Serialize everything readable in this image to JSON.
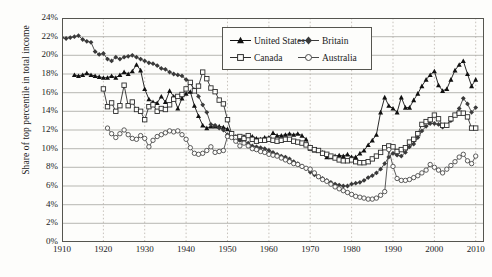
{
  "chart_data": {
    "type": "line",
    "title": "",
    "xlabel": "",
    "ylabel": "Share of top percentile in total income",
    "xlim": [
      1910,
      2012
    ],
    "ylim": [
      0,
      24
    ],
    "grid": true,
    "y_tick_labels": [
      "0%",
      "2%",
      "4%",
      "6%",
      "8%",
      "10%",
      "12%",
      "14%",
      "16%",
      "18%",
      "20%",
      "22%",
      "24%"
    ],
    "y_tick_values": [
      0,
      2,
      4,
      6,
      8,
      10,
      12,
      14,
      16,
      18,
      20,
      22,
      24
    ],
    "x_tick_labels": [
      "1910",
      "1920",
      "1930",
      "1940",
      "1950",
      "1960",
      "1970",
      "1980",
      "1990",
      "2000",
      "2010"
    ],
    "x_tick_values": [
      1910,
      1920,
      1930,
      1940,
      1950,
      1960,
      1970,
      1980,
      1990,
      2000,
      2010
    ],
    "legend_position": "top-center",
    "series": [
      {
        "name": "United States",
        "marker": "filled-triangle",
        "color": "#111111",
        "x": [
          1913,
          1914,
          1915,
          1916,
          1917,
          1918,
          1919,
          1920,
          1921,
          1922,
          1923,
          1924,
          1925,
          1926,
          1927,
          1928,
          1929,
          1930,
          1931,
          1932,
          1933,
          1934,
          1935,
          1936,
          1937,
          1938,
          1939,
          1940,
          1941,
          1942,
          1943,
          1944,
          1945,
          1946,
          1947,
          1948,
          1949,
          1950,
          1951,
          1952,
          1953,
          1954,
          1955,
          1956,
          1957,
          1958,
          1959,
          1960,
          1961,
          1962,
          1963,
          1964,
          1965,
          1966,
          1967,
          1968,
          1969,
          1970,
          1971,
          1972,
          1973,
          1974,
          1975,
          1976,
          1977,
          1978,
          1979,
          1980,
          1981,
          1982,
          1983,
          1984,
          1985,
          1986,
          1987,
          1988,
          1989,
          1990,
          1991,
          1992,
          1993,
          1994,
          1995,
          1996,
          1997,
          1998,
          1999,
          2000,
          2001,
          2002,
          2003,
          2004,
          2005,
          2006,
          2007,
          2008,
          2009,
          2010
        ],
        "values": [
          17.9,
          17.8,
          17.9,
          18.1,
          17.9,
          17.8,
          17.7,
          17.6,
          17.6,
          17.8,
          17.6,
          17.9,
          18.2,
          18.0,
          18.3,
          19.0,
          18.4,
          16.4,
          15.3,
          15.0,
          14.9,
          15.6,
          15.0,
          16.2,
          15.6,
          14.3,
          15.4,
          15.9,
          16.1,
          14.6,
          13.5,
          12.5,
          12.2,
          12.4,
          12.4,
          12.4,
          12.3,
          12.1,
          11.6,
          11.3,
          11.0,
          11.3,
          11.4,
          11.3,
          11.1,
          11.0,
          11.2,
          11.2,
          11.7,
          11.4,
          11.4,
          11.5,
          11.6,
          11.5,
          11.6,
          11.4,
          11.0,
          10.0,
          9.8,
          9.8,
          9.6,
          9.1,
          9.1,
          9.2,
          9.3,
          9.2,
          9.4,
          9.1,
          9.1,
          9.5,
          9.8,
          10.4,
          10.9,
          11.5,
          13.9,
          15.5,
          14.6,
          14.3,
          13.9,
          15.5,
          14.4,
          14.4,
          15.2,
          15.9,
          16.7,
          17.4,
          17.9,
          18.3,
          16.8,
          16.2,
          16.4,
          17.4,
          18.4,
          19.0,
          19.4,
          18.0,
          16.7,
          17.4
        ]
      },
      {
        "name": "Britain",
        "marker": "filled-diamond",
        "color": "#3a3a3a",
        "x": [
          1910,
          1911,
          1912,
          1913,
          1914,
          1915,
          1916,
          1917,
          1918,
          1919,
          1920,
          1921,
          1922,
          1923,
          1924,
          1925,
          1926,
          1927,
          1928,
          1929,
          1930,
          1931,
          1932,
          1933,
          1934,
          1935,
          1936,
          1937,
          1938,
          1939,
          1940,
          1941,
          1942,
          1943,
          1944,
          1945,
          1946,
          1947,
          1948,
          1949,
          1950,
          1951,
          1952,
          1953,
          1954,
          1955,
          1956,
          1957,
          1958,
          1959,
          1960,
          1961,
          1962,
          1963,
          1964,
          1965,
          1966,
          1967,
          1968,
          1969,
          1970,
          1971,
          1972,
          1973,
          1974,
          1975,
          1976,
          1977,
          1978,
          1979,
          1980,
          1981,
          1982,
          1983,
          1984,
          1985,
          1986,
          1987,
          1988,
          1989,
          1990,
          1991,
          1992,
          1993,
          1994,
          1995,
          1996,
          1997,
          1998,
          1999,
          2000,
          2001,
          2002,
          2003,
          2004,
          2005,
          2006,
          2007,
          2008,
          2009,
          2010
        ],
        "values": [
          21.9,
          21.8,
          21.9,
          22.0,
          22.1,
          21.7,
          21.5,
          21.4,
          20.4,
          20.1,
          20.2,
          19.6,
          19.4,
          19.8,
          19.6,
          19.8,
          19.9,
          20.0,
          19.8,
          19.6,
          19.4,
          19.2,
          19.1,
          18.9,
          18.6,
          18.5,
          18.2,
          18.0,
          17.9,
          17.8,
          17.4,
          17.1,
          16.3,
          15.6,
          14.7,
          13.9,
          12.6,
          12.5,
          12.2,
          12.0,
          11.5,
          11.3,
          11.0,
          10.9,
          10.8,
          10.6,
          10.3,
          10.2,
          10.1,
          10.0,
          9.8,
          9.6,
          9.4,
          9.2,
          9.1,
          8.9,
          8.6,
          8.4,
          8.1,
          7.9,
          7.5,
          7.2,
          7.0,
          6.8,
          6.6,
          6.4,
          6.2,
          6.1,
          6.0,
          6.0,
          6.2,
          6.3,
          6.4,
          6.6,
          6.9,
          7.1,
          7.4,
          7.8,
          8.4,
          9.1,
          9.5,
          9.3,
          9.2,
          9.6,
          10.2,
          10.5,
          11.2,
          11.9,
          12.4,
          12.7,
          12.7,
          12.6,
          12.3,
          12.5,
          13.0,
          13.6,
          14.3,
          15.4,
          14.8,
          13.9,
          14.4
        ]
      },
      {
        "name": "Canada",
        "marker": "open-square",
        "color": "#2d2d2d",
        "x": [
          1920,
          1921,
          1922,
          1923,
          1924,
          1925,
          1926,
          1927,
          1928,
          1929,
          1930,
          1931,
          1932,
          1933,
          1934,
          1935,
          1936,
          1937,
          1938,
          1939,
          1940,
          1941,
          1942,
          1943,
          1944,
          1945,
          1946,
          1947,
          1948,
          1949,
          1950,
          1951,
          1952,
          1953,
          1954,
          1955,
          1956,
          1957,
          1958,
          1959,
          1960,
          1961,
          1962,
          1963,
          1964,
          1965,
          1966,
          1967,
          1968,
          1969,
          1970,
          1971,
          1972,
          1973,
          1974,
          1975,
          1976,
          1977,
          1978,
          1979,
          1980,
          1981,
          1982,
          1983,
          1984,
          1985,
          1986,
          1987,
          1988,
          1989,
          1990,
          1991,
          1992,
          1993,
          1994,
          1995,
          1996,
          1997,
          1998,
          1999,
          2000,
          2001,
          2002,
          2003,
          2004,
          2005,
          2006,
          2007,
          2008,
          2009,
          2010
        ],
        "values": [
          16.4,
          14.5,
          14.9,
          14.0,
          14.6,
          16.8,
          14.6,
          15.0,
          14.2,
          14.0,
          13.1,
          14.5,
          14.7,
          14.0,
          14.3,
          14.2,
          14.7,
          15.3,
          15.6,
          15.8,
          16.4,
          17.1,
          16.2,
          16.7,
          18.2,
          17.5,
          16.5,
          16.1,
          15.2,
          14.8,
          13.1,
          11.6,
          11.2,
          11.3,
          11.1,
          11.4,
          11.0,
          10.8,
          10.9,
          10.9,
          11.0,
          10.9,
          10.8,
          10.9,
          11.0,
          11.0,
          10.8,
          10.7,
          10.6,
          10.4,
          10.1,
          9.9,
          9.8,
          9.5,
          9.4,
          9.2,
          9.0,
          8.8,
          8.7,
          8.7,
          8.8,
          8.6,
          8.5,
          8.5,
          8.6,
          8.9,
          9.2,
          9.6,
          10.1,
          10.3,
          10.2,
          9.7,
          9.9,
          10.1,
          10.7,
          11.0,
          11.6,
          12.6,
          12.9,
          13.1,
          13.6,
          13.2,
          12.5,
          12.5,
          13.2,
          13.6,
          13.8,
          13.8,
          13.4,
          12.2,
          12.2
        ]
      },
      {
        "name": "Australia",
        "marker": "open-circle",
        "color": "#4a4a4a",
        "x": [
          1921,
          1922,
          1923,
          1924,
          1925,
          1926,
          1927,
          1928,
          1929,
          1930,
          1931,
          1932,
          1933,
          1934,
          1935,
          1936,
          1937,
          1938,
          1939,
          1940,
          1941,
          1942,
          1943,
          1944,
          1945,
          1946,
          1947,
          1948,
          1949,
          1950,
          1951,
          1952,
          1953,
          1954,
          1955,
          1956,
          1957,
          1958,
          1959,
          1960,
          1961,
          1962,
          1963,
          1964,
          1965,
          1966,
          1967,
          1968,
          1969,
          1970,
          1971,
          1972,
          1973,
          1974,
          1975,
          1976,
          1977,
          1978,
          1979,
          1980,
          1981,
          1982,
          1983,
          1984,
          1985,
          1986,
          1987,
          1988,
          1989,
          1990,
          1991,
          1992,
          1993,
          1994,
          1995,
          1996,
          1997,
          1998,
          1999,
          2000,
          2001,
          2002,
          2003,
          2004,
          2005,
          2006,
          2007,
          2008,
          2009,
          2010
        ],
        "values": [
          12.2,
          11.6,
          11.2,
          11.6,
          12.0,
          11.5,
          11.1,
          11.0,
          11.4,
          11.1,
          10.2,
          10.9,
          11.3,
          11.5,
          11.7,
          11.9,
          11.8,
          11.9,
          11.5,
          11.0,
          10.1,
          9.5,
          9.4,
          9.5,
          9.8,
          10.2,
          9.6,
          9.7,
          9.8,
          11.3,
          11.2,
          10.8,
          10.3,
          10.6,
          10.3,
          10.0,
          9.9,
          9.7,
          9.6,
          9.4,
          9.3,
          9.2,
          9.0,
          8.8,
          8.6,
          8.4,
          8.3,
          8.1,
          7.9,
          7.8,
          7.4,
          7.0,
          6.7,
          6.5,
          6.2,
          5.9,
          5.7,
          5.5,
          5.3,
          5.1,
          4.9,
          4.8,
          4.7,
          4.6,
          4.6,
          4.7,
          5.0,
          5.4,
          9.9,
          8.1,
          6.8,
          6.6,
          6.6,
          6.7,
          6.9,
          7.1,
          7.4,
          7.7,
          8.3,
          8.0,
          7.7,
          7.4,
          7.8,
          8.2,
          8.6,
          9.1,
          9.4,
          8.7,
          8.4,
          9.2
        ]
      }
    ]
  }
}
